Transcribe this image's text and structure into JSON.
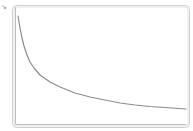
{
  "corner_marker": "↘",
  "chart_data": {
    "type": "line",
    "title": "",
    "xlabel": "",
    "ylabel": "",
    "grid": false,
    "legend": null,
    "x_ticks": [],
    "y_ticks": [],
    "series": [
      {
        "name": "decay-curve",
        "color": "#8c8c8c",
        "points": [
          [
            18,
            16
          ],
          [
            20,
            28
          ],
          [
            22,
            38
          ],
          [
            24,
            46
          ],
          [
            27,
            55
          ],
          [
            30,
            62
          ],
          [
            34,
            68
          ],
          [
            40,
            75
          ],
          [
            50,
            82
          ],
          [
            60,
            87
          ],
          [
            75,
            93
          ],
          [
            90,
            97
          ],
          [
            105,
            100
          ],
          [
            120,
            103
          ],
          [
            135,
            105
          ],
          [
            150,
            106.5
          ],
          [
            165,
            107.5
          ],
          [
            186,
            109
          ]
        ]
      }
    ],
    "frame": {
      "color": "#c8c8c8",
      "axis_color": "#bdbdbd"
    }
  }
}
